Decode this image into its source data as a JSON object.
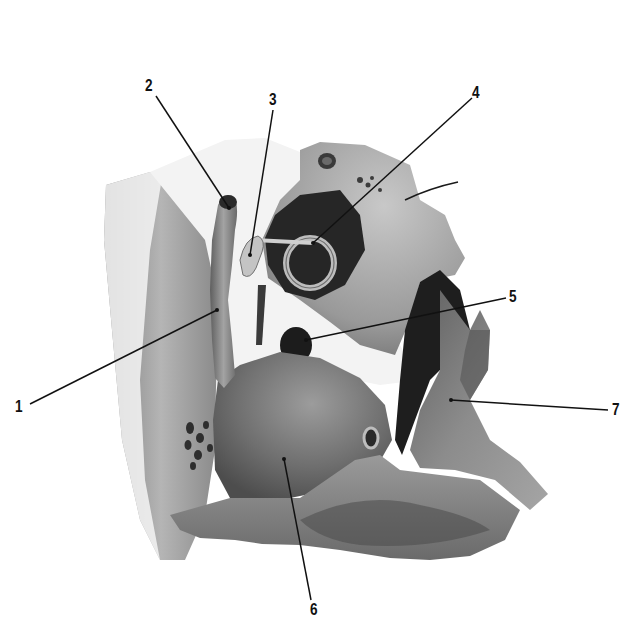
{
  "figure": {
    "labels": [
      {
        "id": "1",
        "text": "1",
        "x": 14,
        "y": 398
      },
      {
        "id": "2",
        "text": "2",
        "x": 144,
        "y": 77
      },
      {
        "id": "3",
        "text": "3",
        "x": 273,
        "y": 91
      },
      {
        "id": "4",
        "text": "4",
        "x": 474,
        "y": 87
      },
      {
        "id": "5",
        "text": "5",
        "x": 508,
        "y": 290
      },
      {
        "id": "6",
        "text": "6",
        "x": 313,
        "y": 602
      },
      {
        "id": "7",
        "text": "7",
        "x": 612,
        "y": 403
      }
    ],
    "leaders": [
      {
        "id": "1",
        "x1": 30,
        "y1": 404,
        "x2": 217,
        "y2": 310
      },
      {
        "id": "2",
        "x1": 156,
        "y1": 96,
        "x2": 229,
        "y2": 210
      },
      {
        "id": "3",
        "x1": 273,
        "y1": 110,
        "x2": 250,
        "y2": 255
      },
      {
        "id": "4",
        "x1": 472,
        "y1": 98,
        "x2": 313,
        "y2": 243
      },
      {
        "id": "5",
        "x1": 506,
        "y1": 298,
        "x2": 306,
        "y2": 340
      },
      {
        "id": "6",
        "x1": 311,
        "y1": 600,
        "x2": 284,
        "y2": 459
      },
      {
        "id": "7",
        "x1": 608,
        "y1": 410,
        "x2": 451,
        "y2": 400
      }
    ],
    "colors": {
      "background": "#ffffff",
      "bone_light": "#f2f2f2",
      "bone_mid": "#9a9a9a",
      "bone_dark": "#5a5a5a",
      "cavity": "#1e1e1e",
      "line": "#111111"
    }
  }
}
